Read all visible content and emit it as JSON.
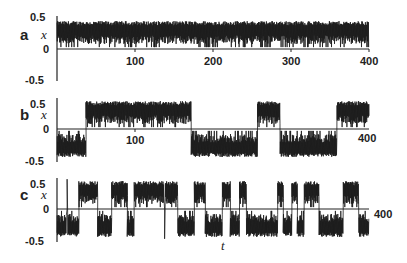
{
  "chart_data": [
    {
      "panel": "a",
      "type": "line",
      "ylabel": "x",
      "xlabel": "",
      "xlim": [
        0,
        400
      ],
      "ylim": [
        -0.5,
        0.5
      ],
      "yticks": [
        "0.5",
        "0",
        "-0.5"
      ],
      "xticks_shown": [
        "100",
        "200",
        "300",
        "400"
      ],
      "description": "Oscillation confined to upper well (x between ~0.05 and 0.45) for the whole run",
      "segments": [
        {
          "t_start": 0,
          "t_end": 400,
          "state": "upper"
        }
      ]
    },
    {
      "panel": "b",
      "type": "line",
      "ylabel": "x",
      "xlabel": "",
      "xlim": [
        0,
        400
      ],
      "ylim": [
        -0.5,
        0.5
      ],
      "yticks": [
        "0.5",
        "0",
        "-0.5"
      ],
      "xticks_shown": [
        "100",
        "400"
      ],
      "description": "Intermittent switching between wells with long residence times",
      "segments": [
        {
          "t_start": 0,
          "t_end": 37,
          "state": "lower"
        },
        {
          "t_start": 37,
          "t_end": 172,
          "state": "upper"
        },
        {
          "t_start": 172,
          "t_end": 257,
          "state": "lower"
        },
        {
          "t_start": 257,
          "t_end": 286,
          "state": "upper"
        },
        {
          "t_start": 286,
          "t_end": 359,
          "state": "lower"
        },
        {
          "t_start": 359,
          "t_end": 400,
          "state": "upper"
        }
      ]
    },
    {
      "panel": "c",
      "type": "line",
      "ylabel": "x",
      "xlabel": "t",
      "xlim": [
        0,
        400
      ],
      "ylim": [
        -0.5,
        0.5
      ],
      "yticks": [
        "0.5",
        "0",
        "-0.5"
      ],
      "xticks_shown": [
        "400"
      ],
      "description": "Frequent chaotic switching between upper and lower wells",
      "segments": [
        {
          "t_start": 0,
          "t_end": 12,
          "state": "lower"
        },
        {
          "t_start": 12,
          "t_end": 14,
          "state": "spike_up"
        },
        {
          "t_start": 14,
          "t_end": 28,
          "state": "lower"
        },
        {
          "t_start": 28,
          "t_end": 52,
          "state": "upper"
        },
        {
          "t_start": 52,
          "t_end": 70,
          "state": "lower"
        },
        {
          "t_start": 70,
          "t_end": 90,
          "state": "upper"
        },
        {
          "t_start": 90,
          "t_end": 99,
          "state": "lower"
        },
        {
          "t_start": 99,
          "t_end": 137,
          "state": "upper"
        },
        {
          "t_start": 137,
          "t_end": 139,
          "state": "spike_down"
        },
        {
          "t_start": 139,
          "t_end": 155,
          "state": "upper"
        },
        {
          "t_start": 155,
          "t_end": 176,
          "state": "lower"
        },
        {
          "t_start": 176,
          "t_end": 190,
          "state": "upper"
        },
        {
          "t_start": 190,
          "t_end": 212,
          "state": "lower"
        },
        {
          "t_start": 212,
          "t_end": 222,
          "state": "upper"
        },
        {
          "t_start": 222,
          "t_end": 234,
          "state": "lower"
        },
        {
          "t_start": 234,
          "t_end": 243,
          "state": "upper"
        },
        {
          "t_start": 243,
          "t_end": 268,
          "state": "lower"
        },
        {
          "t_start": 268,
          "t_end": 283,
          "state": "lower"
        },
        {
          "t_start": 283,
          "t_end": 290,
          "state": "upper"
        },
        {
          "t_start": 290,
          "t_end": 301,
          "state": "lower"
        },
        {
          "t_start": 301,
          "t_end": 308,
          "state": "upper"
        },
        {
          "t_start": 308,
          "t_end": 317,
          "state": "lower"
        },
        {
          "t_start": 317,
          "t_end": 336,
          "state": "upper"
        },
        {
          "t_start": 336,
          "t_end": 355,
          "state": "lower"
        },
        {
          "t_start": 355,
          "t_end": 367,
          "state": "lower"
        },
        {
          "t_start": 367,
          "t_end": 387,
          "state": "upper"
        },
        {
          "t_start": 387,
          "t_end": 400,
          "state": "lower"
        }
      ]
    }
  ],
  "panels": {
    "a": {
      "label": "a",
      "ylabel": "x",
      "ytick_top": "0.5",
      "ytick_mid": "0",
      "ytick_bot": "-0.5",
      "xt100": "100",
      "xt200": "200",
      "xt300": "300",
      "xt400": "400"
    },
    "b": {
      "label": "b",
      "ylabel": "x",
      "ytick_top": "0.5",
      "ytick_mid": "0",
      "ytick_bot": "-0.5",
      "xt100": "100",
      "xt400": "400"
    },
    "c": {
      "label": "c",
      "ylabel": "x",
      "ytick_top": "0.5",
      "ytick_mid": "0",
      "ytick_bot": "-0.5",
      "xt400": "400",
      "xlabel": "t"
    }
  },
  "colors": {
    "trace": "#1a1a1a",
    "axis": "#222222",
    "background": "#ffffff"
  }
}
